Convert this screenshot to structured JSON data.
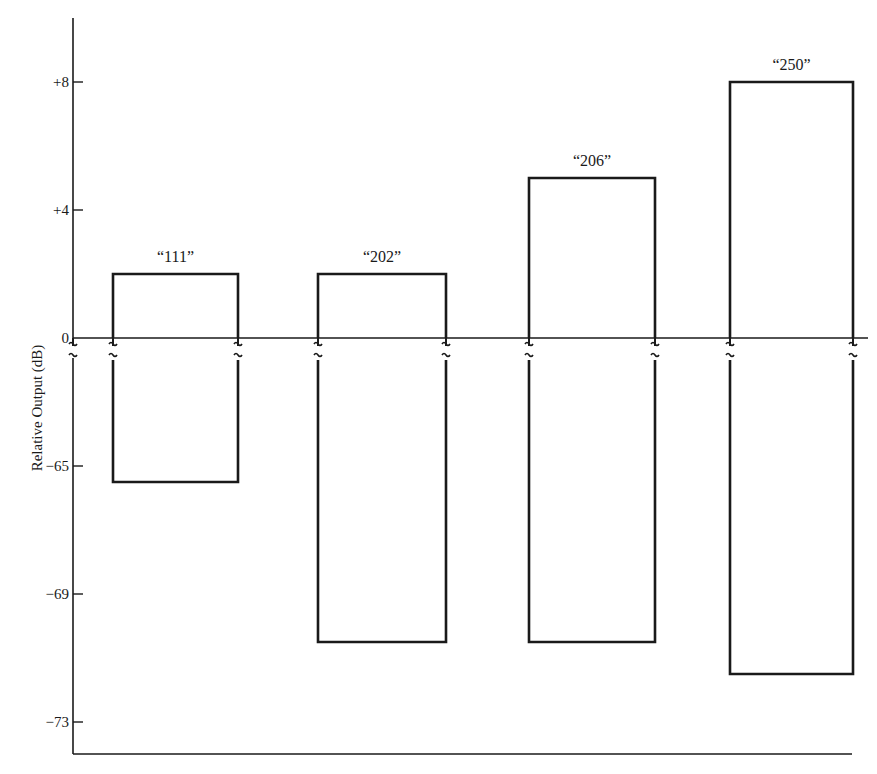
{
  "chart_data": {
    "type": "bar",
    "style": "outline rectangles spanning min to max, broken y-axis between 0 and -65",
    "title": "",
    "xlabel": "",
    "ylabel": "Relative Output (dB)",
    "categories": [
      "“111”",
      "“202”",
      "“206”",
      "“250”"
    ],
    "series": [
      {
        "name": "max",
        "values": [
          2,
          2,
          5,
          8
        ]
      },
      {
        "name": "min",
        "values": [
          -65.5,
          -70.5,
          -70.5,
          -71.5
        ]
      }
    ],
    "yticks": [
      "+8",
      "+4",
      "0",
      "−65",
      "−69",
      "−73"
    ],
    "ytick_values": [
      8,
      4,
      0,
      -65,
      -69,
      -73
    ],
    "axis_break": {
      "between": [
        -65,
        0
      ],
      "symbol": "≈"
    },
    "ylim_upper_segment": [
      0,
      10
    ],
    "ylim_lower_segment": [
      -74,
      -65
    ],
    "grid": false,
    "legend": null
  },
  "colors": {
    "ink": "#1a1a1a",
    "background": "#ffffff"
  }
}
